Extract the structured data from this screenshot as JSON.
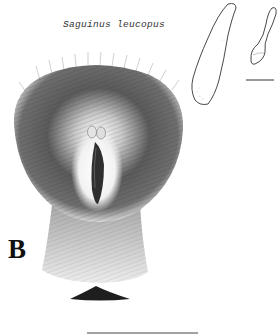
{
  "figure": {
    "species_name": "Saguinus leucopus",
    "panel_label": "B",
    "elements": [
      {
        "name": "baculum-lateral-outline",
        "description": "large elongated outline drawing, upper right"
      },
      {
        "name": "baculum-small-outline",
        "description": "small outline drawing, far upper right"
      },
      {
        "name": "small-scale-bar",
        "description": "short horizontal scale bar under small outline"
      },
      {
        "name": "genital-region-illustration",
        "description": "stippled hair drawing of external genitalia with central dark slit"
      },
      {
        "name": "anal-opening-wedge",
        "description": "dark wedge shape below hair region"
      },
      {
        "name": "large-scale-bar",
        "description": "long horizontal scale bar at bottom center"
      }
    ]
  },
  "colors": {
    "background": "#ffffff",
    "ink": "#222222",
    "hair_dark": "#3a3a3a",
    "hair_light": "#9a9a9a"
  }
}
